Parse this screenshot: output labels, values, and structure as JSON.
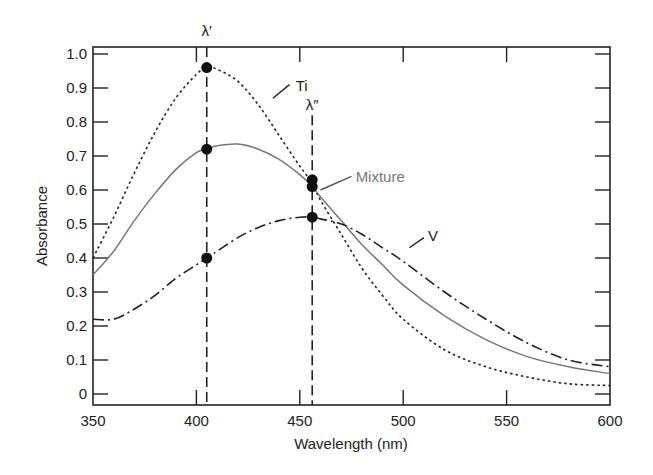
{
  "chart_data": {
    "type": "line",
    "title": "",
    "xlabel": "Wavelength (nm)",
    "ylabel": "Absorbance",
    "xlim": [
      350,
      600
    ],
    "ylim": [
      0,
      1.0
    ],
    "xticks": [
      350,
      400,
      450,
      500,
      550,
      600
    ],
    "yticks": [
      0,
      0.1,
      0.2,
      0.3,
      0.4,
      0.5,
      0.6,
      0.7,
      0.8,
      0.9,
      1.0
    ],
    "ytick_labels": [
      "0",
      "0.1",
      "0.2",
      "0.3",
      "0.4",
      "0.5",
      "0.6",
      "0.7",
      "0.8",
      "0.9",
      "1.0"
    ],
    "grid": false,
    "legend": "inline labels",
    "series": [
      {
        "name": "Ti",
        "style": "dotted",
        "color": "#222222",
        "x": [
          350,
          360,
          370,
          380,
          390,
          400,
          405,
          410,
          420,
          430,
          440,
          450,
          456,
          460,
          470,
          480,
          490,
          500,
          520,
          540,
          560,
          580,
          600
        ],
        "values": [
          0.4,
          0.52,
          0.65,
          0.77,
          0.87,
          0.94,
          0.96,
          0.955,
          0.92,
          0.85,
          0.76,
          0.67,
          0.62,
          0.57,
          0.47,
          0.37,
          0.29,
          0.22,
          0.13,
          0.08,
          0.05,
          0.03,
          0.025
        ]
      },
      {
        "name": "Mixture",
        "style": "solid",
        "color": "#777777",
        "x": [
          350,
          360,
          370,
          380,
          390,
          400,
          405,
          410,
          420,
          430,
          440,
          450,
          456,
          460,
          470,
          480,
          490,
          500,
          520,
          540,
          560,
          580,
          600
        ],
        "values": [
          0.35,
          0.42,
          0.51,
          0.59,
          0.66,
          0.71,
          0.72,
          0.73,
          0.735,
          0.72,
          0.69,
          0.645,
          0.61,
          0.58,
          0.51,
          0.44,
          0.38,
          0.32,
          0.23,
          0.16,
          0.11,
          0.08,
          0.06
        ]
      },
      {
        "name": "V",
        "style": "dash-dot",
        "color": "#222222",
        "x": [
          350,
          360,
          370,
          380,
          390,
          400,
          405,
          410,
          420,
          430,
          440,
          450,
          456,
          460,
          470,
          480,
          490,
          500,
          520,
          540,
          560,
          580,
          600
        ],
        "values": [
          0.22,
          0.22,
          0.25,
          0.29,
          0.34,
          0.38,
          0.4,
          0.42,
          0.46,
          0.49,
          0.51,
          0.52,
          0.52,
          0.515,
          0.5,
          0.47,
          0.43,
          0.39,
          0.3,
          0.22,
          0.15,
          0.1,
          0.08
        ]
      }
    ],
    "markers": [
      {
        "x": 405,
        "y": 0.96,
        "series": "Ti"
      },
      {
        "x": 405,
        "y": 0.72,
        "series": "Mixture"
      },
      {
        "x": 405,
        "y": 0.4,
        "series": "V"
      },
      {
        "x": 456,
        "y": 0.63,
        "series": "Ti"
      },
      {
        "x": 456,
        "y": 0.61,
        "series": "Mixture"
      },
      {
        "x": 456,
        "y": 0.52,
        "series": "V"
      }
    ],
    "vertical_lines": [
      {
        "x": 405,
        "label": "λ′",
        "style": "dashed"
      },
      {
        "x": 456,
        "label": "λ″",
        "style": "dashed"
      }
    ],
    "annotations": [
      {
        "text": "Ti",
        "near_x": 440,
        "near_y": 0.88
      },
      {
        "text": "Mixture",
        "near_x": 470,
        "near_y": 0.63
      },
      {
        "text": "V",
        "near_x": 505,
        "near_y": 0.45
      },
      {
        "text": "λ′",
        "x": 405,
        "position": "above plot"
      },
      {
        "text": "λ″",
        "x": 456,
        "y": 0.8
      }
    ]
  },
  "layout": {
    "plot": {
      "left": 93,
      "top": 47,
      "right": 610,
      "bottom": 405,
      "y0_px": 394,
      "y_per_unit": 340,
      "x_per_nm": 2.068
    }
  }
}
